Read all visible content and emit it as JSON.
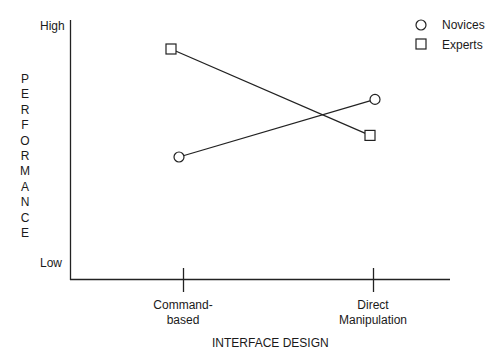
{
  "chart_data": {
    "type": "line",
    "title": "",
    "xlabel": "INTERFACE DESIGN",
    "ylabel": "PERFORMANCE",
    "categories": [
      "Command-based",
      "Direct Manipulation"
    ],
    "category_display": [
      [
        "Command-",
        "based"
      ],
      [
        "Direct",
        "Manipulation"
      ]
    ],
    "y_tick_labels": {
      "high": "High",
      "low": "Low"
    },
    "ylim": [
      0,
      10
    ],
    "y_scale_note": "qualitative axis (Low to High); values estimated on 0-10 scale",
    "grid": false,
    "legend_position": "top-right",
    "series": [
      {
        "name": "Novices",
        "marker": "circle",
        "values": [
          4.5,
          6.9
        ]
      },
      {
        "name": "Experts",
        "marker": "square",
        "values": [
          9.0,
          5.4
        ]
      }
    ]
  },
  "axes": {
    "y_title_letters": [
      "P",
      "E",
      "R",
      "F",
      "O",
      "R",
      "M",
      "A",
      "N",
      "C",
      "E"
    ],
    "y_high": "High",
    "y_low": "Low",
    "x_title": "INTERFACE DESIGN",
    "x_ticks": [
      {
        "line1": "Command-",
        "line2": "based"
      },
      {
        "line1": "Direct",
        "line2": "Manipulation"
      }
    ]
  },
  "legend": [
    {
      "label": "Novices",
      "icon": "circle-marker-icon"
    },
    {
      "label": "Experts",
      "icon": "square-marker-icon"
    }
  ],
  "colors": {
    "ink": "#1a1a1a",
    "background": "#ffffff"
  }
}
